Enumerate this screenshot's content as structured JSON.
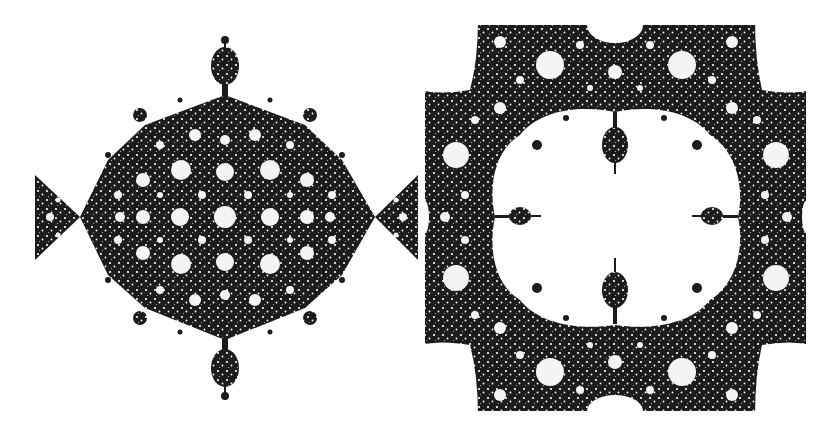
{
  "figure": {
    "panels": [
      {
        "id": "left",
        "description": "Diamond-shaped fractal filled set with symmetric circular holes and satellite bulbs"
      },
      {
        "id": "right",
        "description": "Square fractal region with large central clover-shaped hole and four inner bulbs"
      }
    ],
    "colors": {
      "ink": "#1c1c1c",
      "paper": "#ffffff"
    }
  }
}
